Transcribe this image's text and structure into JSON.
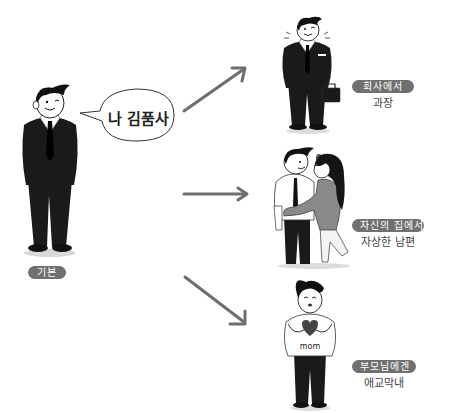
{
  "title_cutoff": "",
  "center": {
    "speech_bubble": "나 김품사",
    "badge": "기본"
  },
  "branches": [
    {
      "badge": "회사에서",
      "subtitle": "과장",
      "figure": "businessman-with-briefcase"
    },
    {
      "badge": "자신의 집에서",
      "subtitle": "자상한 남편",
      "figure": "husband-hugged-by-wife"
    },
    {
      "badge": "부모님에겐",
      "subtitle": "애교막내",
      "figure": "son-heart-hands-mom-shirt"
    }
  ],
  "shirt_text": "mom",
  "colors": {
    "badge_bg": "#707070",
    "arrow": "#6e6e6e",
    "suit": "#1a1a1a",
    "skin": "#ffffff",
    "text": "#444444"
  }
}
